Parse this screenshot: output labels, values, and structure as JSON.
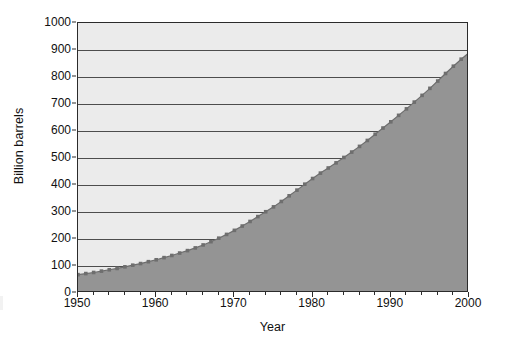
{
  "chart_data": {
    "type": "area",
    "title": "",
    "xlabel": "Year",
    "ylabel": "Billion barrels",
    "xlim": [
      1950,
      2000
    ],
    "ylim": [
      0,
      1000
    ],
    "grid": true,
    "legend": null,
    "x_ticks": [
      "1950",
      "1960",
      "1970",
      "1980",
      "1990",
      "2000"
    ],
    "x_tick_values": [
      1950,
      1960,
      1970,
      1980,
      1990,
      2000
    ],
    "y_ticks": [
      "0",
      "100",
      "200",
      "300",
      "400",
      "500",
      "600",
      "700",
      "800",
      "900",
      "1000"
    ],
    "y_tick_values": [
      0,
      100,
      200,
      300,
      400,
      500,
      600,
      700,
      800,
      900,
      1000
    ],
    "marker": "square",
    "series": [
      {
        "name": "Cumulative oil production",
        "x": [
          1950,
          1951,
          1952,
          1953,
          1954,
          1955,
          1956,
          1957,
          1958,
          1959,
          1960,
          1961,
          1962,
          1963,
          1964,
          1965,
          1966,
          1967,
          1968,
          1969,
          1970,
          1971,
          1972,
          1973,
          1974,
          1975,
          1976,
          1977,
          1978,
          1979,
          1980,
          1981,
          1982,
          1983,
          1984,
          1985,
          1986,
          1987,
          1988,
          1989,
          1990,
          1991,
          1992,
          1993,
          1994,
          1995,
          1996,
          1997,
          1998,
          1999,
          2000
        ],
        "values": [
          68,
          72,
          76,
          81,
          86,
          91,
          97,
          103,
          109,
          116,
          123,
          131,
          139,
          148,
          157,
          167,
          178,
          190,
          203,
          217,
          232,
          248,
          265,
          283,
          301,
          319,
          339,
          360,
          381,
          403,
          424,
          444,
          463,
          482,
          502,
          522,
          543,
          565,
          588,
          611,
          634,
          658,
          682,
          707,
          732,
          758,
          785,
          813,
          840,
          866,
          890
        ]
      }
    ],
    "colors": {
      "plot_background": "#ebebeb",
      "area_fill": "#949494",
      "gridline": "#4d4d4d",
      "axis": "#2b2b2b",
      "marker": "#6e6e6e",
      "text": "#111111",
      "page_background": "#ffffff"
    }
  }
}
